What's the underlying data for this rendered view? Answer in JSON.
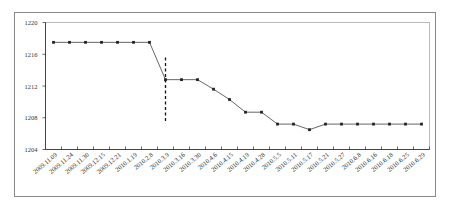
{
  "chart_data": {
    "type": "line",
    "title": "",
    "xlabel": "",
    "ylabel": "",
    "ylim": [
      1204,
      1220
    ],
    "yticks": [
      1204,
      1208,
      1212,
      1216,
      1220
    ],
    "grid": false,
    "legend": "none",
    "categories": [
      "2009.11.09",
      "2009.11.24",
      "2009.11.30",
      "2009.12.15",
      "2009.12.21",
      "2010.1.19",
      "2010.2.8",
      "2010.3.9",
      "2010.3.16",
      "2010.3.30",
      "2010.4.6",
      "2010.4.15",
      "2010.4.19",
      "2010.4.28",
      "2010.5.5",
      "2010.5.11",
      "2010.5.17",
      "2010.5.21",
      "2010.5.27",
      "2010.6.8",
      "2010.6.16",
      "2010.6.18",
      "2010.6.25",
      "2010.6.29"
    ],
    "series": [
      {
        "name": "value",
        "values": [
          1217.5,
          1217.5,
          1217.5,
          1217.5,
          1217.5,
          1217.5,
          1217.5,
          1212.8,
          1212.8,
          1212.8,
          1211.6,
          1210.3,
          1208.7,
          1208.7,
          1207.2,
          1207.2,
          1206.5,
          1207.2,
          1207.2,
          1207.2,
          1207.2,
          1207.2,
          1207.2,
          1207.2
        ],
        "color": "#555555",
        "marker_color": "#222222"
      }
    ],
    "annotations": [
      {
        "type": "vertical-dashed-line",
        "at_category": "2010.3.9",
        "y_range": [
          1207.5,
          1215.6
        ]
      }
    ]
  }
}
